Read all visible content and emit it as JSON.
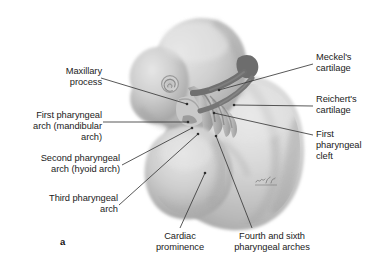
{
  "figure": {
    "panel_letter": "a",
    "artist_signature": "Voll",
    "background_color": "#ffffff",
    "text_color": "#1b1b1b",
    "leader_line_color": "#3a3a3a",
    "embryo_body_light": "#d5d5d5",
    "embryo_body_mid": "#b4b4b4",
    "embryo_body_dark": "#8d8d8d",
    "cartilage_color": "#6e6e6e"
  },
  "labels": {
    "maxillary_process": "Maxillary\nprocess",
    "first_pharyngeal_arch": "First pharyngeal\narch (mandibular\narch)",
    "second_pharyngeal_arch": "Second pharyngeal\narch (hyoid arch)",
    "third_pharyngeal_arch": "Third pharyngeal\narch",
    "meckels_cartilage": "Meckel's\ncartilage",
    "reicherts_cartilage": "Reichert's\ncartilage",
    "first_pharyngeal_cleft": "First\npharyngeal\ncleft",
    "cardiac_prominence": "Cardiac\nprominence",
    "fourth_sixth_pharyngeal_arches": "Fourth and sixth\npharyngeal arches"
  },
  "leader_lines": [
    {
      "name": "maxillary-process",
      "x1": 101,
      "y1": 78,
      "x2": 187,
      "y2": 104
    },
    {
      "name": "first-pharyngeal-arch",
      "x1": 103,
      "y1": 122,
      "x2": 188,
      "y2": 122
    },
    {
      "name": "second-pharyngeal-arch",
      "x1": 122,
      "y1": 165,
      "x2": 192,
      "y2": 128
    },
    {
      "name": "third-pharyngeal-arch",
      "x1": 119,
      "y1": 205,
      "x2": 198,
      "y2": 134
    },
    {
      "name": "meckels-cartilage",
      "x1": 313,
      "y1": 64,
      "x2": 219,
      "y2": 90
    },
    {
      "name": "reicherts-cartilage",
      "x1": 313,
      "y1": 106,
      "x2": 234,
      "y2": 105
    },
    {
      "name": "first-pharyngeal-cleft",
      "x1": 313,
      "y1": 135,
      "x2": 214,
      "y2": 113
    },
    {
      "name": "cardiac-prominence",
      "x1": 180,
      "y1": 228,
      "x2": 205,
      "y2": 173
    },
    {
      "name": "fourth-sixth-arches",
      "x1": 252,
      "y1": 228,
      "x2": 216,
      "y2": 136
    }
  ]
}
